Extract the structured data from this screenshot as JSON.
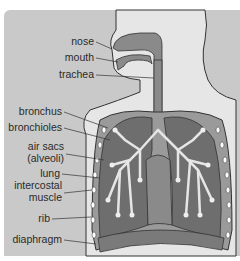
{
  "diagram": {
    "colors": {
      "background": "#c9c9c9",
      "body": "#e6e6e6",
      "airway": "#8a8a8a",
      "lung": "#6e6e6e",
      "outline": "#333333"
    },
    "labels": [
      {
        "id": "nose",
        "text": "nose"
      },
      {
        "id": "mouth",
        "text": "mouth"
      },
      {
        "id": "trachea",
        "text": "trachea"
      },
      {
        "id": "bronchus",
        "text": "bronchus"
      },
      {
        "id": "bronchioles",
        "text": "bronchioles"
      },
      {
        "id": "air-sacs",
        "text": "air sacs"
      },
      {
        "id": "alveoli",
        "text": "(alveoli)"
      },
      {
        "id": "lung",
        "text": "lung"
      },
      {
        "id": "intercostal",
        "text": "intercostal"
      },
      {
        "id": "muscle",
        "text": "muscle"
      },
      {
        "id": "rib",
        "text": "rib"
      },
      {
        "id": "diaphragm",
        "text": "diaphragm"
      }
    ]
  }
}
